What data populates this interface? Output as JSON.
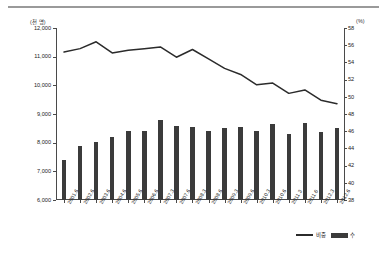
{
  "chart_data": {
    "type": "bar",
    "title": "",
    "subtitle": "",
    "xlabel": "",
    "ylabel": "",
    "grid": false,
    "legend_position": "bottom-right",
    "left_axis": {
      "unit_label": "(천 명)",
      "min": 6000,
      "max": 12000,
      "step": 1000,
      "ticks": [
        "6,000",
        "7,000",
        "8,000",
        "9,000",
        "10,000",
        "11,000",
        "12,000"
      ],
      "tick_values": [
        6000,
        7000,
        8000,
        9000,
        10000,
        11000,
        12000
      ]
    },
    "right_axis": {
      "unit_label": "(%)",
      "min": 38,
      "max": 58,
      "step": 2,
      "ticks": [
        "38",
        "40",
        "42",
        "44",
        "46",
        "48",
        "50",
        "52",
        "54",
        "56",
        "58"
      ],
      "tick_values": [
        38,
        40,
        42,
        44,
        46,
        48,
        50,
        52,
        54,
        56,
        58
      ]
    },
    "categories": [
      "2001.6",
      "2002.6",
      "2003.6",
      "2004.6",
      "2005.6",
      "2006.6",
      "2007.3",
      "2007.6",
      "2008.3",
      "2008.6",
      "2009.3",
      "2009.6",
      "2010.3",
      "2010.6",
      "2011.3",
      "2011.6",
      "2012.3",
      "2012.6"
    ],
    "series": [
      {
        "name": "비중",
        "type": "line",
        "axis": "right",
        "unit": "%",
        "color": "#2b2b2b",
        "values": [
          55.2,
          55.6,
          56.4,
          55.1,
          55.4,
          55.6,
          55.8,
          54.6,
          55.5,
          54.4,
          53.3,
          52.6,
          51.4,
          51.6,
          50.4,
          50.8,
          49.6,
          49.2
        ]
      },
      {
        "name": "수",
        "type": "bar",
        "axis": "left",
        "unit": "천 명",
        "color": "#3b3b3b",
        "values": [
          7390,
          7880,
          8010,
          8200,
          8420,
          8420,
          8790,
          8580,
          8560,
          8410,
          8520,
          8560,
          8390,
          8640,
          8290,
          8690,
          8380,
          8520
        ]
      }
    ]
  },
  "legend": {
    "items": [
      {
        "label": "비중",
        "marker": "line"
      },
      {
        "label": "수",
        "marker": "bar"
      }
    ]
  }
}
